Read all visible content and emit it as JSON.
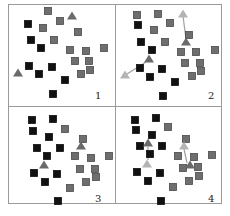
{
  "colors": {
    "frame": "#9a9a9a",
    "cluster_a": "#111111",
    "cluster_b": "#6e6e6e",
    "cluster_b_stroke": "#4a4a4a",
    "centroid": "#6a6a6a",
    "centroid_prev": "#b4b4b4",
    "arrow": "#a0a0a0"
  },
  "panels": [
    {
      "id": "1",
      "label": "1",
      "label_pos": [
        95,
        101
      ],
      "black": [
        [
          28,
          24
        ],
        [
          31,
          40
        ],
        [
          41,
          48
        ],
        [
          29,
          66
        ],
        [
          39,
          74
        ],
        [
          52,
          67
        ],
        [
          65,
          80
        ],
        [
          53,
          94
        ]
      ],
      "gray": [
        [
          48,
          11
        ],
        [
          60,
          21
        ],
        [
          43,
          28
        ],
        [
          78,
          32
        ],
        [
          54,
          40
        ],
        [
          70,
          50
        ],
        [
          86,
          51
        ],
        [
          104,
          48
        ],
        [
          75,
          61
        ],
        [
          89,
          61
        ],
        [
          90,
          70
        ],
        [
          81,
          74
        ]
      ],
      "centroids": [
        [
          72,
          16
        ],
        [
          18,
          73
        ]
      ],
      "prev_centroids": [],
      "arrows": []
    },
    {
      "id": "2",
      "label": "2",
      "label_pos": [
        208,
        101
      ],
      "black": [
        [
          138,
          25
        ],
        [
          141,
          42
        ],
        [
          152,
          50
        ],
        [
          140,
          68
        ],
        [
          150,
          77
        ],
        [
          162,
          69
        ],
        [
          175,
          82
        ],
        [
          163,
          96
        ]
      ],
      "gray": [
        [
          137,
          15
        ],
        [
          158,
          14
        ],
        [
          170,
          23
        ],
        [
          154,
          30
        ],
        [
          189,
          35
        ],
        [
          165,
          42
        ],
        [
          181,
          52
        ],
        [
          196,
          52
        ],
        [
          215,
          50
        ],
        [
          185,
          63
        ],
        [
          200,
          63
        ],
        [
          201,
          71
        ],
        [
          192,
          76
        ]
      ],
      "centroids": [
        [
          186,
          42
        ],
        [
          149,
          59
        ]
      ],
      "prev_centroids": [
        [
          183,
          14
        ],
        [
          125,
          75
        ]
      ],
      "arrows": [
        [
          [
            186,
            39
          ],
          [
            183,
            16
          ]
        ],
        [
          [
            146,
            62
          ],
          [
            127,
            74
          ]
        ]
      ]
    },
    {
      "id": "3",
      "label": "3",
      "label_pos": [
        95,
        204
      ],
      "black": [
        [
          32,
          120
        ],
        [
          53,
          119
        ],
        [
          33,
          131
        ],
        [
          49,
          137
        ],
        [
          37,
          148
        ],
        [
          60,
          148
        ],
        [
          47,
          156
        ],
        [
          34,
          173
        ],
        [
          57,
          174
        ],
        [
          45,
          182
        ],
        [
          58,
          201
        ]
      ],
      "gray": [
        [
          65,
          129
        ],
        [
          83,
          139
        ],
        [
          75,
          156
        ],
        [
          91,
          158
        ],
        [
          109,
          156
        ],
        [
          80,
          169
        ],
        [
          95,
          169
        ],
        [
          96,
          177
        ],
        [
          86,
          182
        ],
        [
          70,
          188
        ]
      ],
      "centroids": [
        [
          81,
          146
        ],
        [
          44,
          165
        ]
      ],
      "prev_centroids": [],
      "arrows": []
    },
    {
      "id": "4",
      "label": "4",
      "label_pos": [
        208,
        204
      ],
      "black": [
        [
          135,
          120
        ],
        [
          156,
          118
        ],
        [
          136,
          130
        ],
        [
          152,
          135
        ],
        [
          140,
          146
        ],
        [
          162,
          146
        ],
        [
          150,
          154
        ],
        [
          137,
          172
        ],
        [
          160,
          173
        ],
        [
          148,
          181
        ],
        [
          161,
          201
        ]
      ],
      "gray": [
        [
          168,
          127
        ],
        [
          186,
          139
        ],
        [
          178,
          156
        ],
        [
          194,
          157
        ],
        [
          212,
          155
        ],
        [
          183,
          168
        ],
        [
          198,
          167
        ],
        [
          199,
          176
        ],
        [
          189,
          181
        ],
        [
          173,
          187
        ]
      ],
      "centroids": [
        [
          148,
          143
        ],
        [
          190,
          165
        ]
      ],
      "prev_centroids": [
        [
          147,
          164
        ],
        [
          184,
          146
        ]
      ],
      "arrows": [
        [
          [
            148,
            160
          ],
          [
            148,
            147
          ]
        ],
        [
          [
            187,
            163
          ],
          [
            184,
            149
          ]
        ]
      ]
    }
  ]
}
